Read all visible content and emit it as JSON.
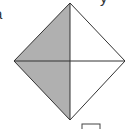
{
  "figure": {
    "type": "square-divided-into-quarters",
    "shaded_fraction": "1/2",
    "shaded_region": "left half",
    "colors": {
      "shade": "#b0b0b0",
      "stroke": "#333333",
      "background": "#ffffff"
    }
  },
  "labels": {
    "top_left_fragment": "a",
    "top_right_fragment": "y"
  },
  "answer_box": {
    "value": ""
  }
}
